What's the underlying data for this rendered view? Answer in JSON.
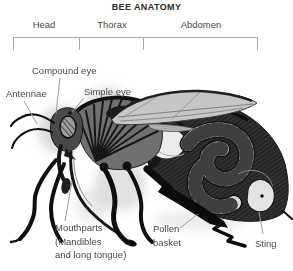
{
  "title": "BEE ANATOMY",
  "sections": [
    "Head",
    "Thorax",
    "Abdomen"
  ],
  "labels": {
    "compound_eye": "Compound eye",
    "antennae": "Antennae",
    "simple_eye": "Simple eye",
    "mouthparts": [
      "Mouthparts",
      "(Mandibles",
      "and long tongue)"
    ],
    "pollen_basket": [
      "Pollen",
      "basket"
    ],
    "sting": "Sting"
  },
  "illustration": {
    "description": "Cutaway side view of a honey bee showing external and internal anatomy",
    "parts": [
      "antennae",
      "compound-eye",
      "simple-eye",
      "mouthparts-tongue",
      "thorax-flight-muscles",
      "wing",
      "legs",
      "pollen-basket",
      "abdomen",
      "honey-stomach",
      "intestine-coil",
      "venom-sac",
      "sting"
    ]
  },
  "colors": {
    "title_text": "#2b2b2b",
    "label_text": "#4a4a4a",
    "leader_line": "#9b9b9b",
    "bracket_line": "#ababab",
    "ink": "#161616",
    "wing_fill": "#c6c6c6",
    "organ_light": "#dcdcdc",
    "halo": "#bdbdbd"
  }
}
